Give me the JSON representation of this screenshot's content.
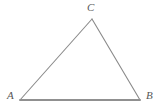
{
  "figure": {
    "kind": "geometry-diagram",
    "shape": "triangle",
    "background_color": "#ffffff",
    "stroke_color": "#8a8a8a",
    "base_stroke_color": "#909090",
    "label_color": "#575757",
    "width": 164,
    "height": 111
  },
  "labels": {
    "a": "A",
    "b": "B",
    "c": "C"
  },
  "chart_data": {
    "type": "scatter",
    "title": "",
    "xlabel": "",
    "ylabel": "",
    "grid": false,
    "legend": "none",
    "xlim": [
      0,
      164
    ],
    "ylim": [
      0,
      111
    ],
    "vertices": [
      {
        "name": "A",
        "x": 20,
        "y": 100
      },
      {
        "name": "B",
        "x": 140,
        "y": 100
      },
      {
        "name": "C",
        "x": 92,
        "y": 19
      }
    ],
    "edges": [
      {
        "from": "A",
        "to": "B",
        "stroke_width": 1.8
      },
      {
        "from": "A",
        "to": "C",
        "stroke_width": 1.1
      },
      {
        "from": "C",
        "to": "B",
        "stroke_width": 1.1
      }
    ]
  }
}
